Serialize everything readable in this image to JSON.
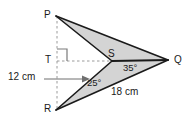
{
  "figure": {
    "background_color": "#ffffff",
    "fill_color": "#d4d4d4",
    "stroke_color": "#1a1a1a",
    "dash_color": "#8c8c8c",
    "vertices": {
      "P": {
        "label": "P",
        "x": 56,
        "y": 16
      },
      "Q": {
        "label": "Q",
        "x": 168,
        "y": 60
      },
      "R": {
        "label": "R",
        "x": 56,
        "y": 110
      },
      "S": {
        "label": "S",
        "x": 112,
        "y": 61
      },
      "T": {
        "label": "T",
        "x": 57,
        "y": 61
      }
    },
    "angles": [
      {
        "name": "angle-SQP",
        "label": "35°",
        "value": 35,
        "unit": "degree"
      },
      {
        "name": "angle-SRQ",
        "label": "25°",
        "value": 25,
        "unit": "degree"
      }
    ],
    "measurements": [
      {
        "name": "height-TS",
        "label": "12 cm",
        "value": 12,
        "unit": "cm"
      },
      {
        "name": "side-RQ",
        "label": "18 cm",
        "value": 18,
        "unit": "cm"
      }
    ],
    "right_angle_marker": {
      "name": "right-angle-at-T",
      "value": 90,
      "unit": "degree"
    }
  }
}
